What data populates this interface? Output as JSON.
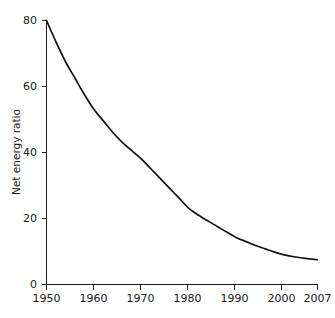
{
  "chart_data": {
    "type": "line",
    "title": "",
    "subtitle": "",
    "xlabel": "",
    "ylabel": "Net energy ratio",
    "xlim": [
      1950,
      2007
    ],
    "ylim": [
      0,
      80
    ],
    "grid": false,
    "legend": false,
    "legend_position": "none",
    "xticks": [
      1950,
      1960,
      1970,
      1980,
      1990,
      2000,
      2007
    ],
    "xtick_labels": [
      "1950",
      "1960",
      "1970",
      "1980",
      "1990",
      "2000",
      "2007"
    ],
    "yticks": [
      0,
      20,
      40,
      60,
      80
    ],
    "ytick_labels": [
      "0",
      "20",
      "40",
      "60",
      "80"
    ],
    "series": [
      {
        "name": "Net energy ratio",
        "color": "#111111",
        "x": [
          1950,
          1952,
          1954,
          1956,
          1958,
          1960,
          1962,
          1964,
          1966,
          1968,
          1970,
          1972,
          1974,
          1976,
          1977,
          1978,
          1980,
          1982,
          1984,
          1986,
          1988,
          1990,
          1992,
          1994,
          1996,
          1998,
          2000,
          2002,
          2004,
          2007
        ],
        "y": [
          80.0,
          73.5,
          67.5,
          62.5,
          57.5,
          53.0,
          49.5,
          46.0,
          43.0,
          40.5,
          38.0,
          35.0,
          32.0,
          29.0,
          27.5,
          26.0,
          23.0,
          21.0,
          19.2,
          17.5,
          15.8,
          14.2,
          13.0,
          11.8,
          10.8,
          9.8,
          9.0,
          8.4,
          8.0,
          7.5
        ]
      }
    ]
  },
  "axes": {
    "ylabel": "Net energy ratio",
    "xtick_labels": [
      "1950",
      "1960",
      "1970",
      "1980",
      "1990",
      "2000",
      "2007"
    ],
    "ytick_labels": [
      "0",
      "20",
      "40",
      "60",
      "80"
    ]
  }
}
